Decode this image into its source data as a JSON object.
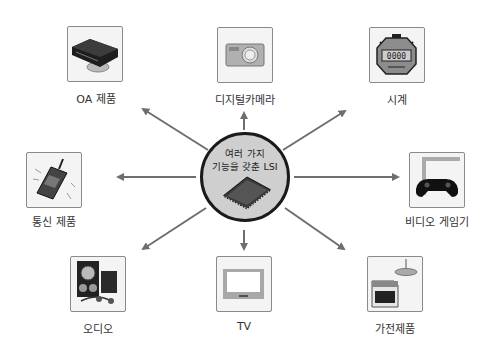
{
  "center": {
    "line1": "여러 가지",
    "line2": "기능을 갖춘 LSI",
    "icon": "lsi-chip-icon"
  },
  "nodes": [
    {
      "id": "oa",
      "label": "OA 제품",
      "icon": "vcr-player-icon"
    },
    {
      "id": "camera",
      "label": "디지털카메라",
      "icon": "digital-camera-icon"
    },
    {
      "id": "clock",
      "label": "시계",
      "icon": "stopwatch-icon"
    },
    {
      "id": "comm",
      "label": "통신 제품",
      "icon": "mobile-phone-icon"
    },
    {
      "id": "game",
      "label": "비디오 게임기",
      "icon": "gamepad-icon"
    },
    {
      "id": "audio",
      "label": "오디오",
      "icon": "speakers-icon"
    },
    {
      "id": "tv",
      "label": "TV",
      "icon": "television-icon"
    },
    {
      "id": "appliance",
      "label": "가전제품",
      "icon": "stove-lamp-icon"
    }
  ],
  "colors": {
    "arrow": "#6e6e6e",
    "hub_fill": "#cfcfcf",
    "hub_border": "#1a1a1a",
    "box_border": "#8a8a8a"
  }
}
